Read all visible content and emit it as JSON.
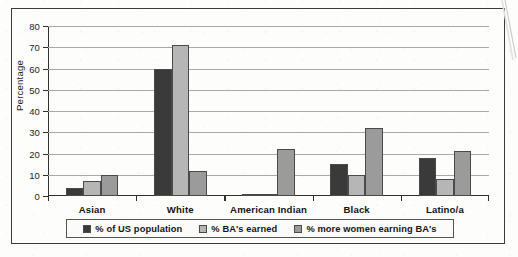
{
  "chart_data": {
    "type": "bar",
    "title": "",
    "xlabel": "",
    "ylabel": "Percentage",
    "ylim": [
      0,
      80
    ],
    "yticks": [
      0,
      10,
      20,
      30,
      40,
      50,
      60,
      70,
      80
    ],
    "grid": true,
    "legend_position": "bottom",
    "categories": [
      "Asian",
      "White",
      "American Indian",
      "Black",
      "Latino/a"
    ],
    "series": [
      {
        "name": "% of US population",
        "color": "#3a3a3a",
        "values": [
          4,
          60,
          1,
          15,
          18
        ]
      },
      {
        "name": "% BA's earned",
        "color": "#b6b6b6",
        "values": [
          7,
          71,
          1,
          10,
          8
        ]
      },
      {
        "name": "% more women earning BA's",
        "color": "#9b9b9b",
        "values": [
          10,
          12,
          22,
          32,
          21
        ]
      }
    ]
  },
  "legend": {
    "items": [
      {
        "label": "% of US population",
        "color": "#3a3a3a"
      },
      {
        "label": "% BA's earned",
        "color": "#b6b6b6"
      },
      {
        "label": "% more women earning BA's",
        "color": "#9b9b9b"
      }
    ]
  }
}
